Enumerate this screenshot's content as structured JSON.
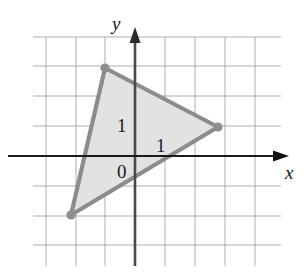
{
  "figure": {
    "width": 306,
    "height": 272,
    "background": "#ffffff"
  },
  "axes": {
    "x_label": "x",
    "y_label": "y",
    "origin_px": [
      135,
      156
    ],
    "unit_px": 29.7,
    "x_axis_color": "#1a1a1a",
    "y_axis_color": "#4a4a4a",
    "x_axis_y_px": 156,
    "y_axis_x_px": 135,
    "x_axis_from_px": 8,
    "x_axis_to_px": 282,
    "y_axis_from_px": 266,
    "y_axis_to_px": 34
  },
  "grid": {
    "color": "#9a9a9a",
    "line_width": 0.8,
    "vertical_x_px": [
      46,
      76,
      105,
      135,
      165,
      195,
      225,
      255
    ],
    "horizontal_y_px": [
      37,
      66,
      96,
      126,
      156,
      186,
      216,
      245
    ],
    "vertical_top_px": 37,
    "vertical_bottom_px": 266,
    "horizontal_left_px": 33,
    "horizontal_right_px": 281
  },
  "labels": {
    "unit_y": "1",
    "unit_x": "1",
    "origin": "0"
  },
  "chart_data": {
    "type": "scatter",
    "title": "",
    "xlabel": "x",
    "ylabel": "y",
    "xlim": [
      -3,
      4
    ],
    "ylim": [
      -3,
      3
    ],
    "grid": true,
    "legend": false,
    "shapes": [
      {
        "kind": "polygon",
        "name": "shaded-triangle",
        "vertices": [
          [
            -1,
            3
          ],
          [
            3,
            1
          ],
          [
            -2,
            -2
          ]
        ],
        "vertices_px": [
          [
            105,
            68
          ],
          [
            218,
            127
          ],
          [
            71,
            215
          ]
        ],
        "fill": "#e2e2e2",
        "stroke": "#8c8c8c",
        "stroke_width": 4.2,
        "vertex_markers": true,
        "vertex_marker_radius_px": 4.6,
        "vertex_marker_color": "#8e8e8e"
      }
    ],
    "annotations": [
      {
        "text": "1",
        "x": -0.6,
        "y": 1.0,
        "px": [
          117,
          116
        ]
      },
      {
        "text": "1",
        "x": 0.7,
        "y": 0.35,
        "px": [
          156,
          136
        ]
      },
      {
        "text": "0",
        "x": -0.6,
        "y": -0.35,
        "px": [
          117,
          162
        ]
      }
    ]
  }
}
